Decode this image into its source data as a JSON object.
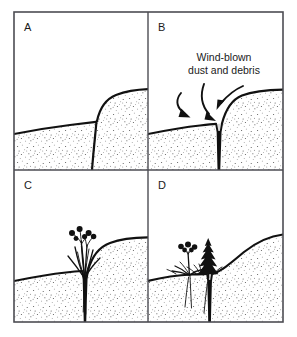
{
  "figure": {
    "panel_count": 4,
    "background_color": "#ffffff",
    "frame_color": "#4d4d53",
    "ink_color": "#111111",
    "soil_texture": "stipple"
  },
  "panels": [
    {
      "id": "A",
      "label": "A",
      "stage_description": "Fresh fault scarp: downthrown block on the left, upthrown block on the right, separated by a near-vertical fault plane.",
      "has_fissure": false,
      "has_vegetation": false
    },
    {
      "id": "B",
      "label": "B",
      "stage_description": "Open fissure along the fault plane collects wind-blown dust and debris at the surface.",
      "has_fissure": true,
      "has_vegetation": false,
      "callout": {
        "line1": "Wind-blown",
        "line2": "dust and debris",
        "arrow_count": 3
      }
    },
    {
      "id": "C",
      "label": "C",
      "stage_description": "Fissure fill retains moisture; a single flowering plant with grass-like leaves colonizes the crack.",
      "has_fissure": true,
      "has_vegetation": true,
      "plants": [
        {
          "type": "flowering-herb",
          "flower_count": 6
        }
      ]
    },
    {
      "id": "D",
      "label": "D",
      "stage_description": "Scarp face degrades to a smooth slope; dense vegetation including a conifer-like shrub and flowering herbs occupies the fissure line.",
      "has_fissure": true,
      "has_vegetation": true,
      "plants": [
        {
          "type": "flowering-herb",
          "flower_count": 5
        },
        {
          "type": "conifer-shrub",
          "flower_count": 0
        }
      ]
    }
  ],
  "caption": {
    "visible": true,
    "text": "",
    "note": "partially cropped line of text at the bottom edge"
  }
}
